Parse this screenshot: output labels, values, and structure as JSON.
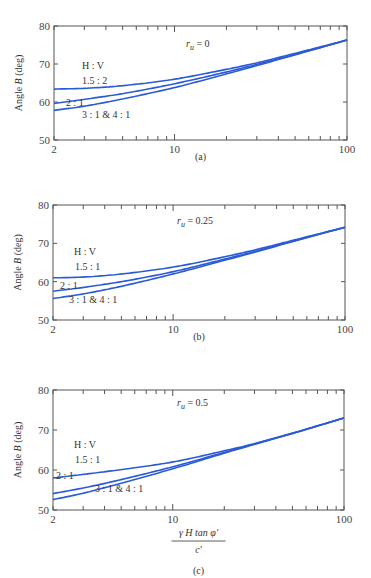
{
  "figure": {
    "ylabel": "Angle B (deg)",
    "xlabel_num": "γ H tan φ′",
    "xlabel_den": "c′",
    "legend_title": "H : V",
    "xticks": [
      "2",
      "10",
      "100"
    ],
    "yticks": [
      "50",
      "60",
      "70",
      "80"
    ]
  },
  "panels": [
    {
      "caption": "(a)",
      "annotation": "r_u = 0",
      "ru_label": "r",
      "ru_sub": "u",
      "ru_value": " = 0",
      "labels": {
        "top": "1.5 : 2",
        "mid": "2 : 1",
        "bot": "3 : 1 & 4 : 1"
      }
    },
    {
      "caption": "(b)",
      "annotation": "r_u = 0.25",
      "ru_label": "r",
      "ru_sub": "u",
      "ru_value": " = 0.25",
      "labels": {
        "top": "1.5 : 1",
        "mid": "2 : 1",
        "bot": "3 : 1 & 4 : 1"
      }
    },
    {
      "caption": "(c)",
      "annotation": "r_u = 0.5",
      "ru_label": "r",
      "ru_sub": "u",
      "ru_value": " = 0.5",
      "labels": {
        "top": "1.5 : 1",
        "mid": "2 : 1",
        "bot": "3 : 1 & 4 : 1"
      }
    }
  ],
  "chart_data": [
    {
      "type": "line",
      "title": "(a) r_u = 0",
      "xlabel": "γH tan φ′ / c′",
      "ylabel": "Angle B (deg)",
      "xscale": "log",
      "xlim": [
        2,
        100
      ],
      "ylim": [
        50,
        80
      ],
      "x": [
        2,
        3,
        5,
        10,
        20,
        30,
        50,
        100
      ],
      "series": [
        {
          "name": "1.5 : 2",
          "values": [
            63.4,
            63.6,
            64.3,
            66.0,
            68.6,
            70.3,
            72.8,
            76.3
          ]
        },
        {
          "name": "2 : 1",
          "values": [
            59.6,
            60.7,
            62.2,
            64.8,
            67.9,
            69.9,
            72.5,
            76.3
          ]
        },
        {
          "name": "3 : 1 & 4 : 1",
          "values": [
            57.8,
            58.9,
            60.8,
            63.8,
            67.4,
            69.6,
            72.4,
            76.3
          ]
        }
      ],
      "legend": {
        "title": "H : V",
        "position": "inline-left"
      }
    },
    {
      "type": "line",
      "title": "(b) r_u = 0.25",
      "xlabel": "γH tan φ′ / c′",
      "ylabel": "Angle B (deg)",
      "xscale": "log",
      "xlim": [
        2,
        100
      ],
      "ylim": [
        50,
        80
      ],
      "x": [
        2,
        3,
        5,
        10,
        20,
        30,
        50,
        100
      ],
      "series": [
        {
          "name": "1.5 : 1",
          "values": [
            61.0,
            61.2,
            62.0,
            63.8,
            66.5,
            68.3,
            70.8,
            74.2
          ]
        },
        {
          "name": "2 : 1",
          "values": [
            57.5,
            58.5,
            60.0,
            62.6,
            65.9,
            67.9,
            70.6,
            74.2
          ]
        },
        {
          "name": "3 : 1 & 4 : 1",
          "values": [
            55.6,
            56.8,
            58.8,
            62.0,
            65.6,
            67.7,
            70.5,
            74.2
          ]
        }
      ],
      "legend": {
        "title": "H : V",
        "position": "inline-left"
      }
    },
    {
      "type": "line",
      "title": "(c) r_u = 0.5",
      "xlabel": "γH tan φ′ / c′",
      "ylabel": "Angle B (deg)",
      "xscale": "log",
      "xlim": [
        2,
        100
      ],
      "ylim": [
        50,
        80
      ],
      "x": [
        2,
        3,
        5,
        10,
        20,
        30,
        50,
        100
      ],
      "series": [
        {
          "name": "1.5 : 1",
          "values": [
            58.0,
            58.9,
            60.1,
            62.0,
            64.8,
            66.6,
            69.2,
            73.0
          ]
        },
        {
          "name": "2 : 1",
          "values": [
            54.1,
            55.5,
            57.6,
            60.8,
            64.4,
            66.5,
            69.2,
            73.0
          ]
        },
        {
          "name": "3 : 1 & 4 : 1",
          "values": [
            52.6,
            54.2,
            56.7,
            60.3,
            64.2,
            66.4,
            69.1,
            73.0
          ]
        }
      ],
      "legend": {
        "title": "H : V",
        "position": "inline-left"
      }
    }
  ]
}
